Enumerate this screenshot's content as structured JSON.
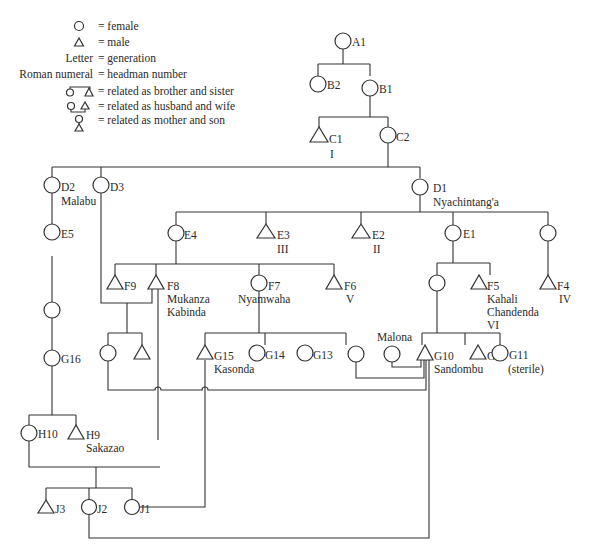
{
  "legend": {
    "items": [
      {
        "symbol": "circle",
        "text": "= female"
      },
      {
        "symbol": "triangle",
        "text": "= male"
      },
      {
        "symbol": "Letter",
        "text": "= generation"
      },
      {
        "symbol": "Roman numeral",
        "text": "= headman number"
      },
      {
        "symbol": "sibling-pair",
        "text": "= related as brother and sister"
      },
      {
        "symbol": "spouse-pair",
        "text": "= related as husband and wife"
      },
      {
        "symbol": "mother-son",
        "text": "= related as mother and son"
      }
    ]
  },
  "people": {
    "A1": {
      "id": "A1",
      "sex": "female"
    },
    "B2": {
      "id": "B2",
      "sex": "female"
    },
    "B1": {
      "id": "B1",
      "sex": "female"
    },
    "C1": {
      "id": "C1",
      "sex": "male",
      "headman": "I"
    },
    "C2": {
      "id": "C2",
      "sex": "female"
    },
    "D2": {
      "id": "D2",
      "sex": "female",
      "name": "Malabu"
    },
    "D3": {
      "id": "D3",
      "sex": "female"
    },
    "D1": {
      "id": "D1",
      "sex": "female",
      "name": "Nyachintang'a"
    },
    "E5": {
      "id": "E5",
      "sex": "female"
    },
    "E4": {
      "id": "E4",
      "sex": "female"
    },
    "E3": {
      "id": "E3",
      "sex": "male",
      "headman": "III"
    },
    "E2": {
      "id": "E2",
      "sex": "male",
      "headman": "II"
    },
    "E1": {
      "id": "E1",
      "sex": "female"
    },
    "F9": {
      "id": "F9",
      "sex": "male"
    },
    "F8": {
      "id": "F8",
      "sex": "male",
      "name1": "Mukanza",
      "name2": "Kabinda"
    },
    "F7": {
      "id": "F7",
      "sex": "female",
      "name": "Nyamwaha"
    },
    "F6": {
      "id": "F6",
      "sex": "male",
      "headman": "V"
    },
    "F5": {
      "id": "F5",
      "sex": "male",
      "name1": "Kahali",
      "name2": "Chandenda",
      "headman": "VI"
    },
    "F4": {
      "id": "F4",
      "sex": "male",
      "headman": "IV"
    },
    "G16": {
      "id": "G16",
      "sex": "female"
    },
    "G15": {
      "id": "G15",
      "sex": "male",
      "name": "Kasonda"
    },
    "G14": {
      "id": "G14",
      "sex": "female"
    },
    "G13": {
      "id": "G13",
      "sex": "female"
    },
    "G10": {
      "id": "G10",
      "sex": "male",
      "name": "Sandombu"
    },
    "G9": {
      "id": "G9",
      "sex": "male"
    },
    "G11": {
      "id": "G11",
      "sex": "female",
      "note": "(sterile)"
    },
    "Malona": {
      "name": "Malona",
      "sex": "female"
    },
    "H10": {
      "id": "H10",
      "sex": "female"
    },
    "H9": {
      "id": "H9",
      "sex": "male",
      "name": "Sakazao"
    },
    "J3": {
      "id": "J3",
      "sex": "male"
    },
    "J2": {
      "id": "J2",
      "sex": "female"
    },
    "J1": {
      "id": "J1",
      "sex": "female"
    }
  }
}
